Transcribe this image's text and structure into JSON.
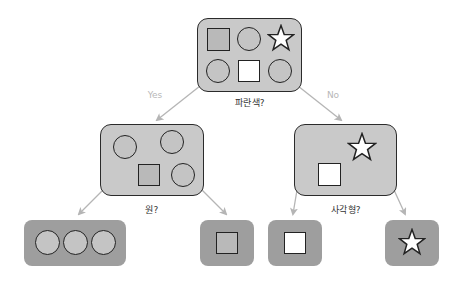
{
  "colors": {
    "inner_fill": "#c9c9c9",
    "leaf_fill": "#9e9e9e",
    "outline": "#222222",
    "edge": "#b5b5b5",
    "edge_label": "#b8b8b8",
    "question_text": "#333333"
  },
  "root": {
    "question": "파란색?",
    "shapes": [
      "gray-square",
      "gray-circle",
      "white-star",
      "gray-circle",
      "white-square",
      "gray-circle"
    ]
  },
  "edges": {
    "yes_label": "Yes",
    "no_label": "No"
  },
  "left_node": {
    "question": "원?",
    "shapes": [
      "gray-circle",
      "gray-circle",
      "gray-square",
      "gray-circle"
    ]
  },
  "right_node": {
    "question": "사각형?",
    "shapes": [
      "white-star",
      "white-square"
    ]
  },
  "leaves": [
    {
      "name": "leaf-circles",
      "shapes": [
        "gray-circle",
        "gray-circle",
        "gray-circle"
      ]
    },
    {
      "name": "leaf-gray-square",
      "shapes": [
        "gray-square"
      ]
    },
    {
      "name": "leaf-white-square",
      "shapes": [
        "white-square"
      ]
    },
    {
      "name": "leaf-star",
      "shapes": [
        "white-star"
      ]
    }
  ]
}
